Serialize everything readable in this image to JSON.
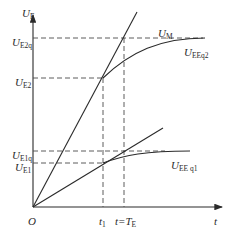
{
  "diagram": {
    "axes": {
      "y_label": {
        "main": "U",
        "sub": "E"
      },
      "x_label": "t",
      "origin_label": "O"
    },
    "x_ticks": [
      {
        "main": "t",
        "sub": "1"
      },
      {
        "main": "t=T",
        "sub": "E"
      }
    ],
    "y_ticks": [
      {
        "main": "U",
        "sub": "E2q"
      },
      {
        "main": "U",
        "sub": "E2"
      },
      {
        "main": "U",
        "sub": "E1q"
      },
      {
        "main": "U",
        "sub": "E1"
      }
    ],
    "curve_labels": [
      {
        "main": "U",
        "sub": "M"
      },
      {
        "main": "U",
        "sub": "EEq2"
      },
      {
        "main": "U",
        "sub": "EE q1"
      }
    ],
    "colors": {
      "line": "#2a2a2a",
      "dash": "#4a4a4a",
      "background": "#ffffff"
    }
  }
}
